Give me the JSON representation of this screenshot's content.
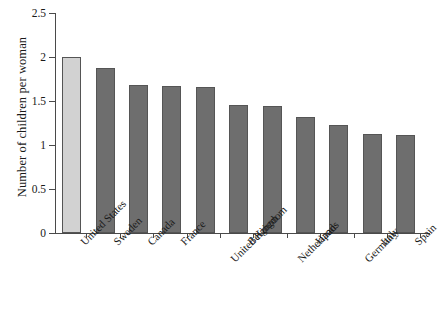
{
  "chart_data": {
    "type": "bar",
    "title": "",
    "subtitle": "",
    "xlabel": "",
    "ylabel": "Number of children per woman",
    "categories": [
      "United States",
      "Sweden",
      "Canada",
      "France",
      "United Kingdom",
      "Belgium",
      "Netherlands",
      "Japan",
      "Germany",
      "Italy",
      "Spain"
    ],
    "values": [
      2.0,
      1.88,
      1.68,
      1.67,
      1.66,
      1.45,
      1.44,
      1.32,
      1.23,
      1.12,
      1.11
    ],
    "ylim": [
      0,
      2.5
    ],
    "yticks": [
      0,
      0.5,
      1,
      1.5,
      2,
      2.5
    ],
    "ytick_labels": [
      "0",
      "0.5",
      "1",
      "1.5",
      "2",
      "2.5"
    ],
    "grid": false,
    "legend": "none",
    "bar_colors": [
      "#d2d2d2",
      "#6e6e6e",
      "#6e6e6e",
      "#6e6e6e",
      "#6e6e6e",
      "#6e6e6e",
      "#6e6e6e",
      "#6e6e6e",
      "#6e6e6e",
      "#6e6e6e",
      "#6e6e6e"
    ],
    "bar_border_color": "#555555",
    "highlight_category": "United States",
    "axis_color": "#4a4a4a",
    "background_color": "#ffffff",
    "text_color": "#1a1a1a",
    "label_rotation_degrees": 45,
    "label_stagger_rows": [
      0,
      0,
      0,
      0,
      1,
      0,
      1,
      0,
      1,
      0,
      0
    ]
  }
}
